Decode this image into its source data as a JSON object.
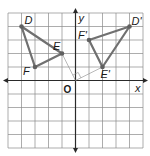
{
  "diagram": {
    "type": "coordinate-plane-rotation",
    "grid": {
      "xmin": -5,
      "xmax": 5,
      "ymin": -5,
      "ymax": 5
    },
    "axes": {
      "x_label": "x",
      "y_label": "y",
      "origin_label": "O"
    },
    "colors": {
      "triangle": "#707070",
      "grid": "#8a8a8a",
      "axis": "#2a2a2a"
    },
    "original": {
      "name": "triangle-DEF",
      "vertices": [
        {
          "label": "D",
          "x": -4,
          "y": 4
        },
        {
          "label": "E",
          "x": -1,
          "y": 2
        },
        {
          "label": "F",
          "x": -3,
          "y": 1
        }
      ]
    },
    "image": {
      "name": "triangle-D'E'F'",
      "vertices": [
        {
          "label": "D'",
          "x": 4,
          "y": 4
        },
        {
          "label": "E'",
          "x": 2,
          "y": 1
        },
        {
          "label": "F'",
          "x": 1,
          "y": 3
        }
      ]
    },
    "rotation_guide": {
      "from": "E",
      "to": "E'",
      "center": "O",
      "angle_marker": "right-angle"
    }
  }
}
